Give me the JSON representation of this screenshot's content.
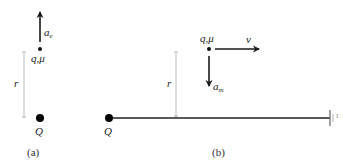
{
  "panel_a": {
    "caption": "(a)",
    "charge_label": "q,μ",
    "acceleration_label": "a",
    "acceleration_subscript": "e",
    "distance_label": "r",
    "source_label": "Q"
  },
  "panel_b": {
    "caption": "(b)",
    "charge_label": "q,μ",
    "velocity_label": "v",
    "acceleration_label": "a",
    "acceleration_subscript": "m",
    "distance_label": "r",
    "source_label": "Q",
    "terminal_label": "I"
  },
  "colors": {
    "ink": "#1a1a1a",
    "guide": "#aaaaaa"
  }
}
